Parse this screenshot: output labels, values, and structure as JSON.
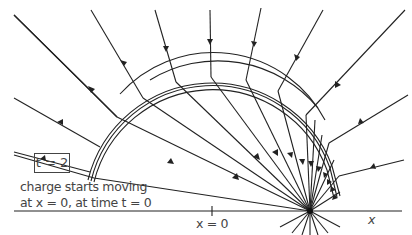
{
  "diagram": {
    "time_label": "t = 2",
    "caption_line1": "charge starts moving",
    "caption_line2": "at x = 0, at time t = 0",
    "origin_label": "x = 0",
    "axis_label": "x",
    "colors": {
      "line": "#222222",
      "text": "#444444",
      "background": "#ffffff"
    }
  }
}
